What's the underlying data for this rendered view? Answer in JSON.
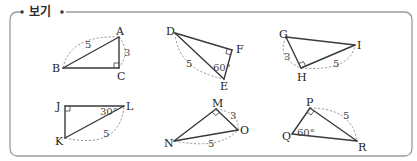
{
  "header": {
    "label": "보기",
    "clipped_text_above": "..."
  },
  "frame": {
    "x": 10,
    "y": 12,
    "w": 402,
    "h": 144,
    "r": 8
  },
  "triangles": [
    {
      "id": "ABC",
      "vertices": [
        {
          "name": "A",
          "x": 119,
          "y": 37,
          "lx": 116,
          "ly": 35
        },
        {
          "name": "B",
          "x": 63,
          "y": 68,
          "lx": 52,
          "ly": 72
        },
        {
          "name": "C",
          "x": 119,
          "y": 68,
          "lx": 117,
          "ly": 80
        }
      ],
      "right_angle_at": "C",
      "measures": [
        {
          "text": "5",
          "x": 85,
          "y": 48,
          "between": [
            "A",
            "B"
          ],
          "arc": "M63,68 Q70,35 119,37"
        },
        {
          "text": "3",
          "x": 124,
          "y": 56,
          "between": [
            "A",
            "C"
          ],
          "arc": "M119,37 Q131,52 119,68"
        }
      ],
      "angles": []
    },
    {
      "id": "DEF",
      "vertices": [
        {
          "name": "D",
          "x": 175,
          "y": 33,
          "lx": 166,
          "ly": 35
        },
        {
          "name": "E",
          "x": 224,
          "y": 79,
          "lx": 220,
          "ly": 90
        },
        {
          "name": "F",
          "x": 232,
          "y": 50,
          "lx": 236,
          "ly": 53
        }
      ],
      "right_angle_at": "F",
      "measures": [
        {
          "text": "5",
          "x": 186,
          "y": 67,
          "between": [
            "D",
            "E"
          ],
          "arc": "M175,33 Q178,70 224,79"
        }
      ],
      "angles": [
        {
          "text": "60°",
          "x": 213,
          "y": 71,
          "at": "E"
        }
      ]
    },
    {
      "id": "GHI",
      "vertices": [
        {
          "name": "G",
          "x": 286,
          "y": 37,
          "lx": 279,
          "ly": 38
        },
        {
          "name": "H",
          "x": 301,
          "y": 68,
          "lx": 297,
          "ly": 81
        },
        {
          "name": "I",
          "x": 355,
          "y": 45,
          "lx": 357,
          "ly": 49
        }
      ],
      "right_angle_at": "H",
      "measures": [
        {
          "text": "3",
          "x": 284,
          "y": 60,
          "between": [
            "G",
            "H"
          ],
          "arc": "M286,37 Q276,58 301,68"
        },
        {
          "text": "5",
          "x": 333,
          "y": 67,
          "between": [
            "H",
            "I"
          ],
          "arc": "M301,68 Q350,72 355,45"
        }
      ],
      "angles": []
    },
    {
      "id": "JKL",
      "vertices": [
        {
          "name": "J",
          "x": 65,
          "y": 106,
          "lx": 56,
          "ly": 110
        },
        {
          "name": "K",
          "x": 65,
          "y": 138,
          "lx": 55,
          "ly": 145
        },
        {
          "name": "L",
          "x": 124,
          "y": 106,
          "lx": 126,
          "ly": 110
        }
      ],
      "right_angle_at": "J",
      "measures": [
        {
          "text": "5",
          "x": 103,
          "y": 137,
          "between": [
            "K",
            "L"
          ],
          "arc": "M65,138 Q120,150 124,106"
        }
      ],
      "angles": [
        {
          "text": "30°",
          "x": 100,
          "y": 115,
          "at": "L"
        }
      ]
    },
    {
      "id": "MNO",
      "vertices": [
        {
          "name": "M",
          "x": 216,
          "y": 109,
          "lx": 212,
          "ly": 107
        },
        {
          "name": "N",
          "x": 174,
          "y": 141,
          "lx": 164,
          "ly": 147
        },
        {
          "name": "O",
          "x": 238,
          "y": 130,
          "lx": 240,
          "ly": 134
        }
      ],
      "right_angle_at": "M",
      "measures": [
        {
          "text": "3",
          "x": 230,
          "y": 119,
          "between": [
            "M",
            "O"
          ],
          "arc": "M216,109 Q240,112 238,130"
        },
        {
          "text": "5",
          "x": 208,
          "y": 147,
          "between": [
            "N",
            "O"
          ],
          "arc": "M174,141 Q220,150 238,130"
        }
      ],
      "angles": []
    },
    {
      "id": "PQR",
      "vertices": [
        {
          "name": "P",
          "x": 310,
          "y": 108,
          "lx": 306,
          "ly": 106
        },
        {
          "name": "Q",
          "x": 292,
          "y": 134,
          "lx": 282,
          "ly": 140
        },
        {
          "name": "R",
          "x": 357,
          "y": 141,
          "lx": 358,
          "ly": 151
        }
      ],
      "right_angle_at": "P",
      "measures": [
        {
          "text": "5",
          "x": 343,
          "y": 119,
          "between": [
            "P",
            "R"
          ],
          "arc": "M310,108 Q352,108 357,141"
        }
      ],
      "angles": [
        {
          "text": "60°",
          "x": 297,
          "y": 136,
          "at": "Q"
        }
      ]
    }
  ]
}
